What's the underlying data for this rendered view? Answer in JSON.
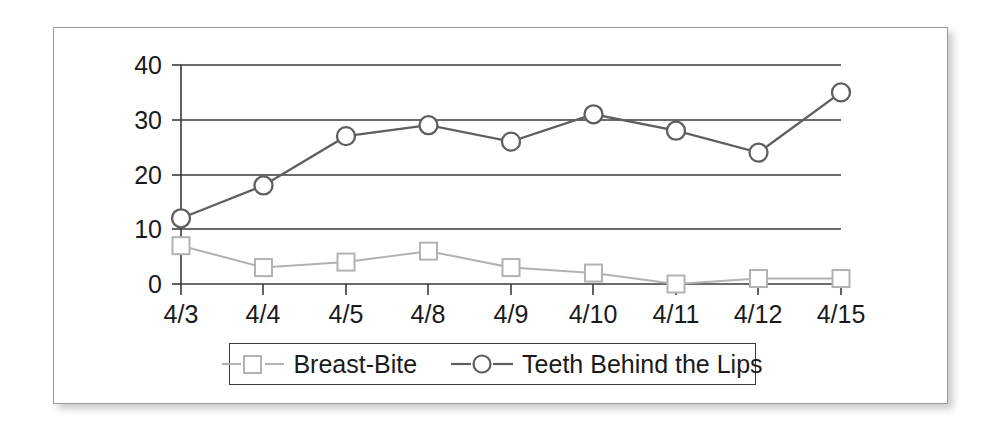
{
  "chart_data": {
    "type": "line",
    "title": "",
    "xlabel": "",
    "ylabel": "",
    "categories": [
      "4/3",
      "4/4",
      "4/5",
      "4/8",
      "4/9",
      "4/10",
      "4/11",
      "4/12",
      "4/15"
    ],
    "yticks": [
      0,
      10,
      20,
      30,
      40
    ],
    "ylim": [
      0,
      40
    ],
    "grid": true,
    "legend_position": "bottom",
    "series": [
      {
        "name": "Breast-Bite",
        "marker": "square",
        "color": "#b2b2b2",
        "values": [
          7,
          3,
          4,
          6,
          3,
          2,
          0,
          1,
          1
        ]
      },
      {
        "name": "Teeth Behind the Lips",
        "marker": "circle",
        "color": "#5f5f5f",
        "values": [
          12,
          18,
          27,
          29,
          26,
          31,
          28,
          24,
          35
        ]
      }
    ]
  },
  "legend": {
    "entries": [
      {
        "label": "Breast-Bite",
        "marker": "square-marker-icon"
      },
      {
        "label": "Teeth Behind the Lips",
        "marker": "circle-marker-icon"
      }
    ]
  },
  "axes": {
    "y_tick_labels": [
      "40",
      "30",
      "20",
      "10",
      "0"
    ],
    "x_tick_labels": [
      "4/3",
      "4/4",
      "4/5",
      "4/8",
      "4/9",
      "4/10",
      "4/11",
      "4/12",
      "4/15"
    ]
  },
  "colors": {
    "series_light": "#b2b2b2",
    "series_dark": "#5f5f5f",
    "axis": "#3a3a3a",
    "frame_border": "#9a9a9a",
    "background": "#ffffff",
    "text": "#1a1a1a"
  }
}
